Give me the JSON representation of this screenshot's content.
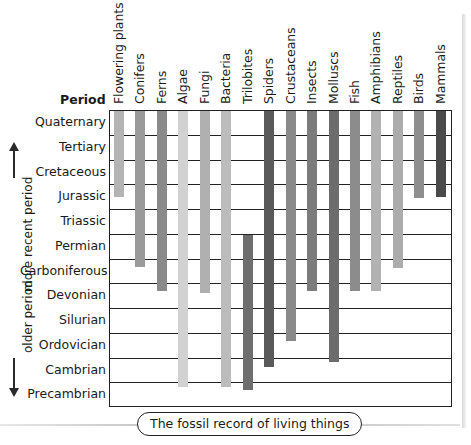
{
  "chart_data": {
    "type": "range-bar",
    "title": "The fossil record of living things",
    "row_header": "Period",
    "side_labels": {
      "top": "more recent period",
      "bottom": "older period"
    },
    "periods": [
      "Quaternary",
      "Tertiary",
      "Cretaceous",
      "Jurassic",
      "Triassic",
      "Permian",
      "Carboniferous",
      "Devonian",
      "Silurian",
      "Ordovician",
      "Cambrian",
      "Precambrian"
    ],
    "series": [
      {
        "name": "Flowering plants",
        "from": "Quaternary",
        "to": "Jurassic",
        "start": 0,
        "end": 3.5,
        "color": "#b4b4b4"
      },
      {
        "name": "Conifers",
        "from": "Quaternary",
        "to": "Carboniferous",
        "start": 0,
        "end": 6.35,
        "color": "#9a9a9a"
      },
      {
        "name": "Ferns",
        "from": "Quaternary",
        "to": "Devonian",
        "start": 0,
        "end": 7.3,
        "color": "#8a8a8a"
      },
      {
        "name": "Algae",
        "from": "Quaternary",
        "to": "Precambrian",
        "start": 0,
        "end": 11.2,
        "color": "#d2d2d2"
      },
      {
        "name": "Fungi",
        "from": "Quaternary",
        "to": "Devonian",
        "start": 0,
        "end": 7.4,
        "color": "#b0b0b0"
      },
      {
        "name": "Bacteria",
        "from": "Quaternary",
        "to": "Precambrian",
        "start": 0,
        "end": 11.2,
        "color": "#bcbcbc"
      },
      {
        "name": "Trilobites",
        "from": "Permian",
        "to": "Precambrian",
        "start": 5.0,
        "end": 11.3,
        "color": "#6e6e6e"
      },
      {
        "name": "Spiders",
        "from": "Quaternary",
        "to": "Cambrian",
        "start": 0,
        "end": 10.4,
        "color": "#5a5a5a"
      },
      {
        "name": "Crustaceans",
        "from": "Quaternary",
        "to": "Ordovician",
        "start": 0,
        "end": 9.35,
        "color": "#8a8a8a"
      },
      {
        "name": "Insects",
        "from": "Quaternary",
        "to": "Devonian",
        "start": 0,
        "end": 7.3,
        "color": "#7c7c7c"
      },
      {
        "name": "Molluscs",
        "from": "Quaternary",
        "to": "Cambrian",
        "start": 0,
        "end": 10.2,
        "color": "#6c6c6c"
      },
      {
        "name": "Fish",
        "from": "Quaternary",
        "to": "Devonian",
        "start": 0,
        "end": 7.3,
        "color": "#8c8c8c"
      },
      {
        "name": "Amphibians",
        "from": "Quaternary",
        "to": "Devonian",
        "start": 0,
        "end": 7.3,
        "color": "#b2b2b2"
      },
      {
        "name": "Reptiles",
        "from": "Quaternary",
        "to": "Carboniferous",
        "start": 0,
        "end": 6.4,
        "color": "#acacac"
      },
      {
        "name": "Birds",
        "from": "Quaternary",
        "to": "Jurassic",
        "start": 0,
        "end": 3.55,
        "color": "#8e8e8e"
      },
      {
        "name": "Mammals",
        "from": "Quaternary",
        "to": "Jurassic",
        "start": 0,
        "end": 3.5,
        "color": "#4a4a4a"
      }
    ],
    "xlabel": "",
    "ylabel": "Period",
    "grid": true
  }
}
